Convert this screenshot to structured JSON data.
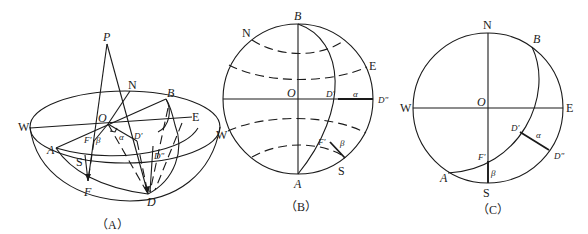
{
  "figure_a": {
    "caption": "（A）",
    "labels": {
      "P": "P",
      "N": "N",
      "B": "B",
      "W": "W",
      "O": "O",
      "E": "E",
      "F_prime": "F'",
      "beta": "β",
      "alpha": "α",
      "D_prime": "D'",
      "A": "A",
      "S": "S",
      "D_dprime": "D\"",
      "F": "F",
      "D": "D"
    }
  },
  "figure_b": {
    "caption": "（B）",
    "labels": {
      "B": "B",
      "N": "N",
      "E": "E",
      "O": "O",
      "D_prime": "D'",
      "alpha": "α",
      "D_dprime": "D\"",
      "W": "W",
      "F_prime": "F'",
      "beta": "β",
      "A": "A",
      "S": "S"
    }
  },
  "figure_c": {
    "caption": "（C）",
    "labels": {
      "N": "N",
      "B": "B",
      "W": "W",
      "O": "O",
      "E": "E",
      "D_prime": "D'",
      "alpha": "α",
      "D_dprime": "D\"",
      "F_prime": "F'",
      "A": "A",
      "beta": "β",
      "S": "S"
    }
  }
}
